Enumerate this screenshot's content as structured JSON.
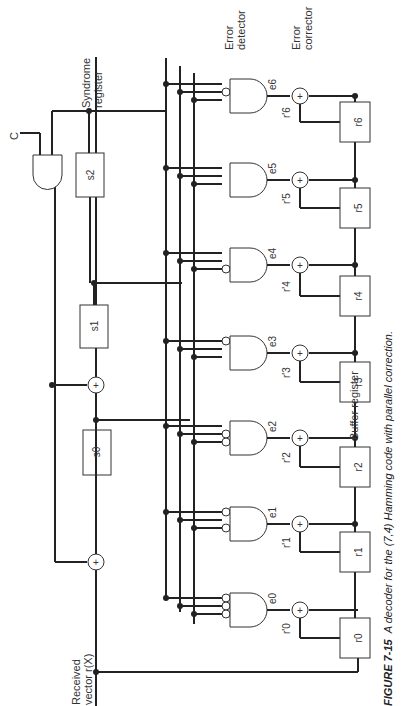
{
  "figure": {
    "caption_label": "FIGURE 7-15",
    "caption_text": "A decoder for the (7,4) Hamming code with parallel correction.",
    "input_label_line1": "Received",
    "input_label_line2": "vector r(X)",
    "control_label": "C",
    "syndrome_label_line1": "Syndrome",
    "syndrome_label_line2": "register",
    "detector_label_line1": "Error",
    "detector_label_line2": "detector",
    "corrector_label_line1": "Error",
    "corrector_label_line2": "corrector",
    "buffer_label": "Buffer register"
  },
  "syndrome_register": [
    "s0",
    "s1",
    "s2"
  ],
  "buffer_register": [
    "r0",
    "r1",
    "r2",
    "r3",
    "r4",
    "r5",
    "r6"
  ],
  "corrected_outputs": [
    "r'0",
    "r'1",
    "r'2",
    "r'3",
    "r'4",
    "r'5",
    "r'6"
  ],
  "error_signals": [
    "e0",
    "e1",
    "e2",
    "e3",
    "e4",
    "e5",
    "e6"
  ],
  "adder_symbol": "+"
}
